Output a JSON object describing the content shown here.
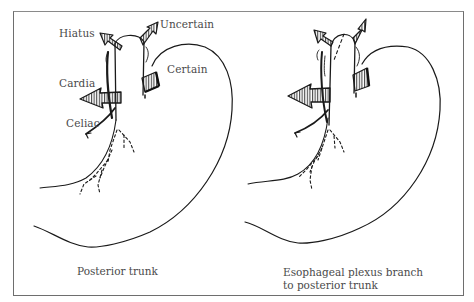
{
  "figure": {
    "panels": [
      {
        "id": "posterior-trunk",
        "caption": "Posterior trunk",
        "labels": {
          "hiatus": "Hiatus",
          "uncertain": "Uncertain",
          "certain": "Certain",
          "cardia": "Cardia",
          "celiac": "Celiac"
        }
      },
      {
        "id": "esophageal-plexus-branch",
        "caption_line1": "Esophageal plexus branch",
        "caption_line2": "to posterior trunk"
      }
    ],
    "colors": {
      "line": "#1a1a1a",
      "text": "#4a4a4a",
      "frame": "#6e6e6e",
      "background": "#ffffff"
    }
  }
}
